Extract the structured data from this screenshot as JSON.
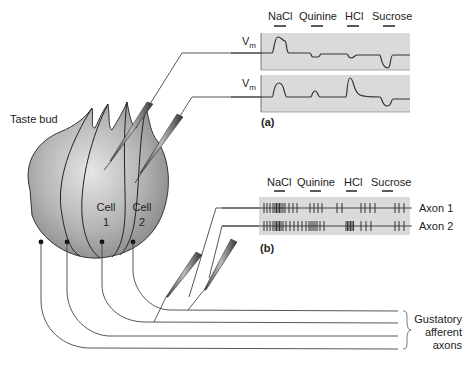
{
  "figure": {
    "taste_bud_label": "Taste bud",
    "cell1": {
      "line1": "Cell",
      "line2": "1"
    },
    "cell2": {
      "line1": "Cell",
      "line2": "2"
    },
    "afferent_label": {
      "line1": "Gustatory",
      "line2": "afferent",
      "line3": "axons"
    }
  },
  "panel_a": {
    "label": "(a)",
    "stimuli": [
      "NaCl",
      "Quinine",
      "HCl",
      "Sucrose"
    ],
    "trace_label_main": "V",
    "trace_label_sub": "m",
    "traces": [
      {
        "name": "Cell 1",
        "responses": {
          "NaCl": "large depolarization",
          "Quinine": "small hyperpolarization",
          "HCl": "small hyperpolarization",
          "Sucrose": "hyperpolarization"
        }
      },
      {
        "name": "Cell 2",
        "responses": {
          "NaCl": "depolarization",
          "Quinine": "small depolarization",
          "HCl": "large depolarization",
          "Sucrose": "hyperpolarization"
        }
      }
    ]
  },
  "panel_b": {
    "label": "(b)",
    "stimuli": [
      "NaCl",
      "Quinine",
      "HCl",
      "Sucrose"
    ],
    "axons": [
      "Axon 1",
      "Axon 2"
    ]
  },
  "colors": {
    "panel_bg": "#d9d9d9",
    "bud_fill": "#b8b8b8",
    "line": "#333333"
  }
}
